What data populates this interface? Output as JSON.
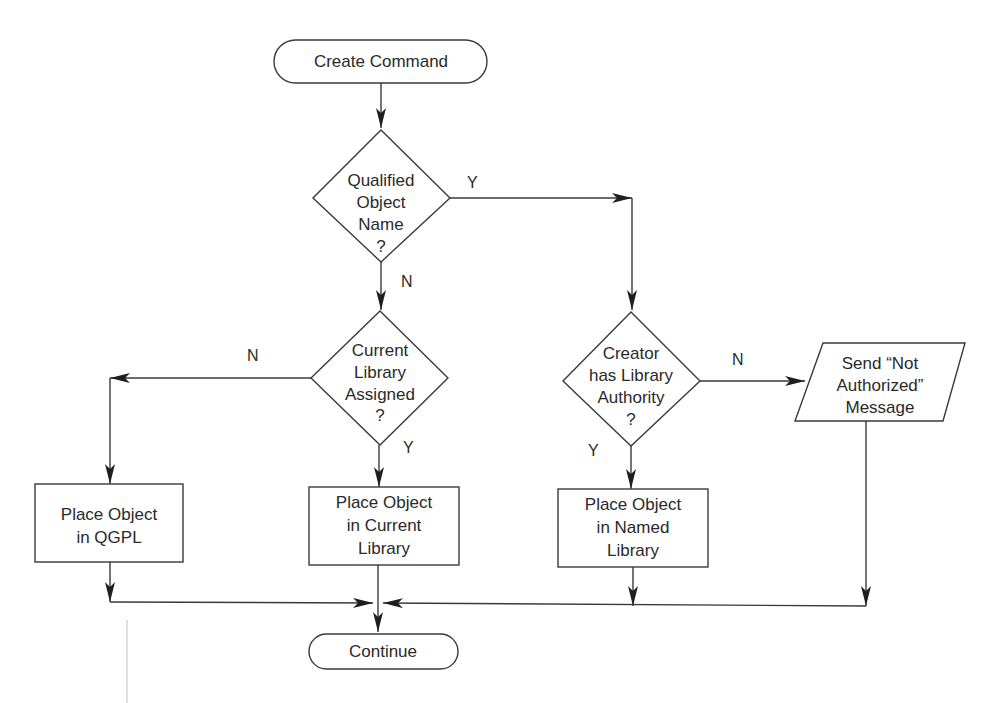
{
  "diagram": {
    "type": "flowchart",
    "nodes": {
      "start": {
        "shape": "terminator",
        "lines": [
          "Create Command"
        ]
      },
      "d1": {
        "shape": "decision",
        "lines": [
          "Qualified",
          "Object",
          "Name",
          "?"
        ]
      },
      "d2": {
        "shape": "decision",
        "lines": [
          "Current",
          "Library",
          "Assigned",
          "?"
        ]
      },
      "d3": {
        "shape": "decision",
        "lines": [
          "Creator",
          "has Library",
          "Authority",
          "?"
        ]
      },
      "msg": {
        "shape": "io",
        "lines": [
          "Send “Not",
          "Authorized”",
          "Message"
        ]
      },
      "p_qgpl": {
        "shape": "process",
        "lines": [
          "Place Object",
          "in QGPL"
        ]
      },
      "p_current": {
        "shape": "process",
        "lines": [
          "Place Object",
          "in Current",
          "Library"
        ]
      },
      "p_named": {
        "shape": "process",
        "lines": [
          "Place Object",
          "in Named",
          "Library"
        ]
      },
      "end": {
        "shape": "terminator",
        "lines": [
          "Continue"
        ]
      }
    },
    "edge_labels": {
      "d1_yes": "Y",
      "d1_no": "N",
      "d2_no": "N",
      "d2_yes": "Y",
      "d3_no": "N",
      "d3_yes": "Y"
    },
    "edges": [
      {
        "from": "start",
        "to": "d1"
      },
      {
        "from": "d1",
        "to": "d3",
        "label": "Y"
      },
      {
        "from": "d1",
        "to": "d2",
        "label": "N"
      },
      {
        "from": "d2",
        "to": "p_qgpl",
        "label": "N"
      },
      {
        "from": "d2",
        "to": "p_current",
        "label": "Y"
      },
      {
        "from": "d3",
        "to": "msg",
        "label": "N"
      },
      {
        "from": "d3",
        "to": "p_named",
        "label": "Y"
      },
      {
        "from": "p_qgpl",
        "to": "end"
      },
      {
        "from": "p_current",
        "to": "end"
      },
      {
        "from": "p_named",
        "to": "end"
      },
      {
        "from": "msg",
        "to": "end"
      }
    ]
  }
}
